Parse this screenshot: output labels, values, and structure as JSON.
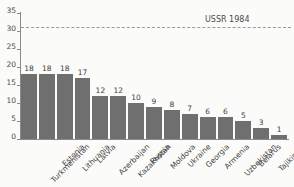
{
  "chart_data": {
    "type": "bar",
    "title": "",
    "subtitle": "",
    "xlabel": "",
    "ylabel": "",
    "ylim": [
      0,
      35
    ],
    "yticks": [
      0,
      5,
      10,
      15,
      20,
      25,
      30,
      35
    ],
    "grid": false,
    "legend": "none",
    "orientation": "vertical",
    "bar_color": "#6f6f6f",
    "categories": [
      "Turkmenistan",
      "Estonia",
      "Lithuania",
      "Latvia",
      "Azerbaijan",
      "Kazakhstan",
      "Russia",
      "Moldova",
      "Ukraine",
      "Georgia",
      "Armenia",
      "Uzbekistan",
      "Belarus",
      "Tajikistan",
      "Kyrgyzstan"
    ],
    "values": [
      18,
      18,
      18,
      17,
      12,
      12,
      10,
      9,
      8,
      7,
      6,
      6,
      5,
      3,
      1
    ],
    "value_labels": [
      "18",
      "18",
      "18",
      "17",
      "12",
      "12",
      "10",
      "9",
      "8",
      "7",
      "6",
      "6",
      "5",
      "3",
      "1"
    ],
    "tick_labels": [
      "0",
      "5",
      "10",
      "15",
      "20",
      "25",
      "30",
      "35"
    ],
    "annotations": [
      {
        "name": "ussr-reference-line",
        "label": "USSR 1984",
        "value": 31,
        "style": "dashed",
        "color": "#9a9a9a"
      }
    ]
  },
  "colors": {
    "background": "#fbfbf9",
    "bar": "#6f6f6f",
    "axis": "#8a8a8a",
    "text": "#3d3d3d",
    "reference": "#9a9a9a"
  }
}
